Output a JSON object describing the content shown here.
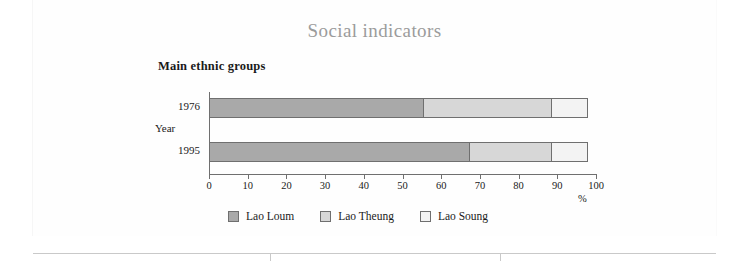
{
  "chart_data": {
    "type": "bar",
    "orientation": "horizontal",
    "stacked": true,
    "title": "Social indicators",
    "subtitle": "Main ethnic groups",
    "xlabel": "%",
    "ylabel": "Year",
    "categories": [
      "1976",
      "1995"
    ],
    "xlim": [
      0,
      100
    ],
    "xticks": [
      0,
      10,
      20,
      30,
      40,
      50,
      60,
      70,
      80,
      90,
      100
    ],
    "grid": false,
    "legend_position": "bottom",
    "series": [
      {
        "name": "Lao Loum",
        "color": "#a9a9a9",
        "values": [
          55.5,
          67.5
        ]
      },
      {
        "name": "Lao Theung",
        "color": "#d7d7d7",
        "values": [
          33.5,
          21.5
        ]
      },
      {
        "name": "Lao Soung",
        "color": "#f3f3f3",
        "values": [
          9.5,
          9.5
        ]
      }
    ]
  },
  "colors": {
    "title": "#9b9b9b",
    "axis": "#6f6f6f",
    "text": "#1a1a1a",
    "rule": "#c9c9c9"
  }
}
